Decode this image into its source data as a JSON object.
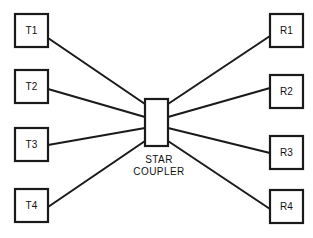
{
  "diagram": {
    "background_color": "#ffffff",
    "line_color": "#1a1a1a",
    "text_color": "#111111",
    "coupler": {
      "name": "star-coupler",
      "label_line1": "STAR",
      "label_line2": "COUPLER",
      "x": 145,
      "y": 99,
      "width": 23,
      "height": 47
    },
    "transmitters": [
      {
        "id": "T1",
        "label": "T1",
        "x": 15,
        "y": 14,
        "width": 33,
        "height": 33,
        "port_x": 48,
        "port_y": 38,
        "coupler_x": 145,
        "coupler_y": 104
      },
      {
        "id": "T2",
        "label": "T2",
        "x": 15,
        "y": 70,
        "width": 33,
        "height": 33,
        "port_x": 48,
        "port_y": 89,
        "coupler_x": 145,
        "coupler_y": 117
      },
      {
        "id": "T3",
        "label": "T3",
        "x": 15,
        "y": 128,
        "width": 33,
        "height": 33,
        "port_x": 48,
        "port_y": 145,
        "coupler_x": 145,
        "coupler_y": 128
      },
      {
        "id": "T4",
        "label": "T4",
        "x": 15,
        "y": 189,
        "width": 33,
        "height": 33,
        "port_x": 48,
        "port_y": 207,
        "coupler_x": 145,
        "coupler_y": 141
      }
    ],
    "receivers": [
      {
        "id": "R1",
        "label": "R1",
        "x": 270,
        "y": 14,
        "width": 33,
        "height": 33,
        "port_x": 270,
        "port_y": 36,
        "coupler_x": 168,
        "coupler_y": 104
      },
      {
        "id": "R2",
        "label": "R2",
        "x": 270,
        "y": 75,
        "width": 33,
        "height": 33,
        "port_x": 270,
        "port_y": 88,
        "coupler_x": 168,
        "coupler_y": 117
      },
      {
        "id": "R3",
        "label": "R3",
        "x": 270,
        "y": 136,
        "width": 33,
        "height": 33,
        "port_x": 270,
        "port_y": 153,
        "coupler_x": 168,
        "coupler_y": 128
      },
      {
        "id": "R4",
        "label": "R4",
        "x": 270,
        "y": 190,
        "width": 33,
        "height": 33,
        "port_x": 270,
        "port_y": 209,
        "coupler_x": 168,
        "coupler_y": 141
      }
    ],
    "coupler_label_pos": {
      "x": 159,
      "y1": 163,
      "y2": 175
    }
  }
}
